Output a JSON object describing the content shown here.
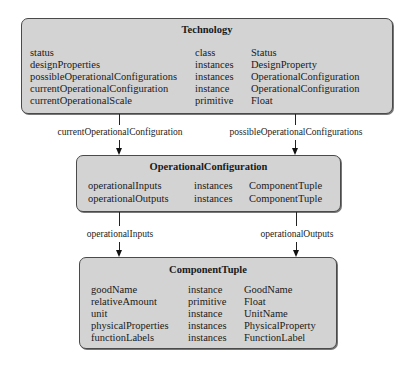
{
  "diagram": {
    "nodes": [
      {
        "id": "technology",
        "title": "Technology",
        "attributes": [
          {
            "name": "status",
            "cardinality": "class",
            "type": "Status"
          },
          {
            "name": "designProperties",
            "cardinality": "instances",
            "type": "DesignProperty"
          },
          {
            "name": "possibleOperationalConfigurations",
            "cardinality": "instances",
            "type": "OperationalConfiguration"
          },
          {
            "name": "currentOperationalConfiguration",
            "cardinality": "instance",
            "type": "OperationalConfiguration"
          },
          {
            "name": "currentOperationalScale",
            "cardinality": "primitive",
            "type": "Float"
          }
        ]
      },
      {
        "id": "operational-configuration",
        "title": "OperationalConfiguration",
        "attributes": [
          {
            "name": "operationalInputs",
            "cardinality": "instances",
            "type": "ComponentTuple"
          },
          {
            "name": "operationalOutputs",
            "cardinality": "instances",
            "type": "ComponentTuple"
          }
        ]
      },
      {
        "id": "component-tuple",
        "title": "ComponentTuple",
        "attributes": [
          {
            "name": "goodName",
            "cardinality": "instance",
            "type": "GoodName"
          },
          {
            "name": "relativeAmount",
            "cardinality": "primitive",
            "type": "Float"
          },
          {
            "name": "unit",
            "cardinality": "instance",
            "type": "UnitName"
          },
          {
            "name": "physicalProperties",
            "cardinality": "instances",
            "type": "PhysicalProperty"
          },
          {
            "name": "functionLabels",
            "cardinality": "instances",
            "type": "FunctionLabel"
          }
        ]
      }
    ],
    "edges": [
      {
        "from": "technology",
        "to": "operational-configuration",
        "label": "currentOperationalConfiguration"
      },
      {
        "from": "technology",
        "to": "operational-configuration",
        "label": "possibleOperationalConfigurations"
      },
      {
        "from": "operational-configuration",
        "to": "component-tuple",
        "label": "operationalInputs"
      },
      {
        "from": "operational-configuration",
        "to": "component-tuple",
        "label": "operationalOutputs"
      }
    ]
  }
}
